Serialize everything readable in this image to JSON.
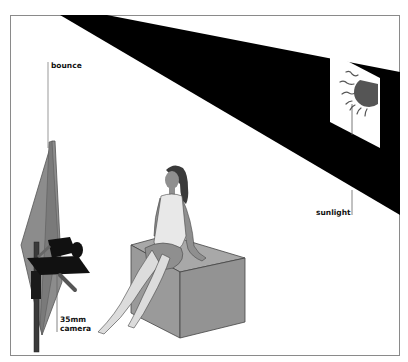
{
  "labels": {
    "bounce": "bounce",
    "sunlight": "sunlight",
    "camera_line1": "35mm",
    "camera_line2": "camera"
  },
  "colors": {
    "background": "#ffffff",
    "frame": "#8a8a8a",
    "sunlight_band": "#000000",
    "sun": "#555555",
    "reflector": "#8c8c8c",
    "cube": "#9a9a9a",
    "skin": "#8f8f8f",
    "hair": "#3a3a3a",
    "garment": "#e8e8e8",
    "camera": "#111111"
  },
  "elements": {
    "sunlight_band": "diagonal black band of sunlight entering through window",
    "window": "parallelogram window with sun",
    "reflector": "bounce card on stand",
    "camera": "35mm camera on tripod bar",
    "model": "seated woman",
    "cube": "cube seat"
  }
}
